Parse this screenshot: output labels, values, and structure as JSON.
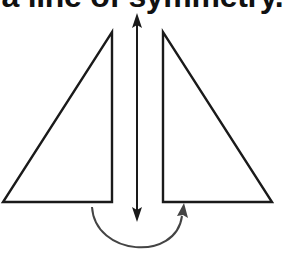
{
  "caption": {
    "text": "a line of symmetry."
  },
  "diagram": {
    "stroke_color": "#1a1a1a",
    "curve_color": "#444444",
    "background": "#ffffff",
    "left_triangle": {
      "points": "112,32 112,202 3,202"
    },
    "right_triangle": {
      "points": "163,32 163,202 272,202"
    },
    "symmetry_line": {
      "x": 137,
      "y_top": 13,
      "y_bottom": 222
    },
    "flip_arrow": {
      "path": "M92,207 C96,255 178,262 184,212"
    }
  }
}
